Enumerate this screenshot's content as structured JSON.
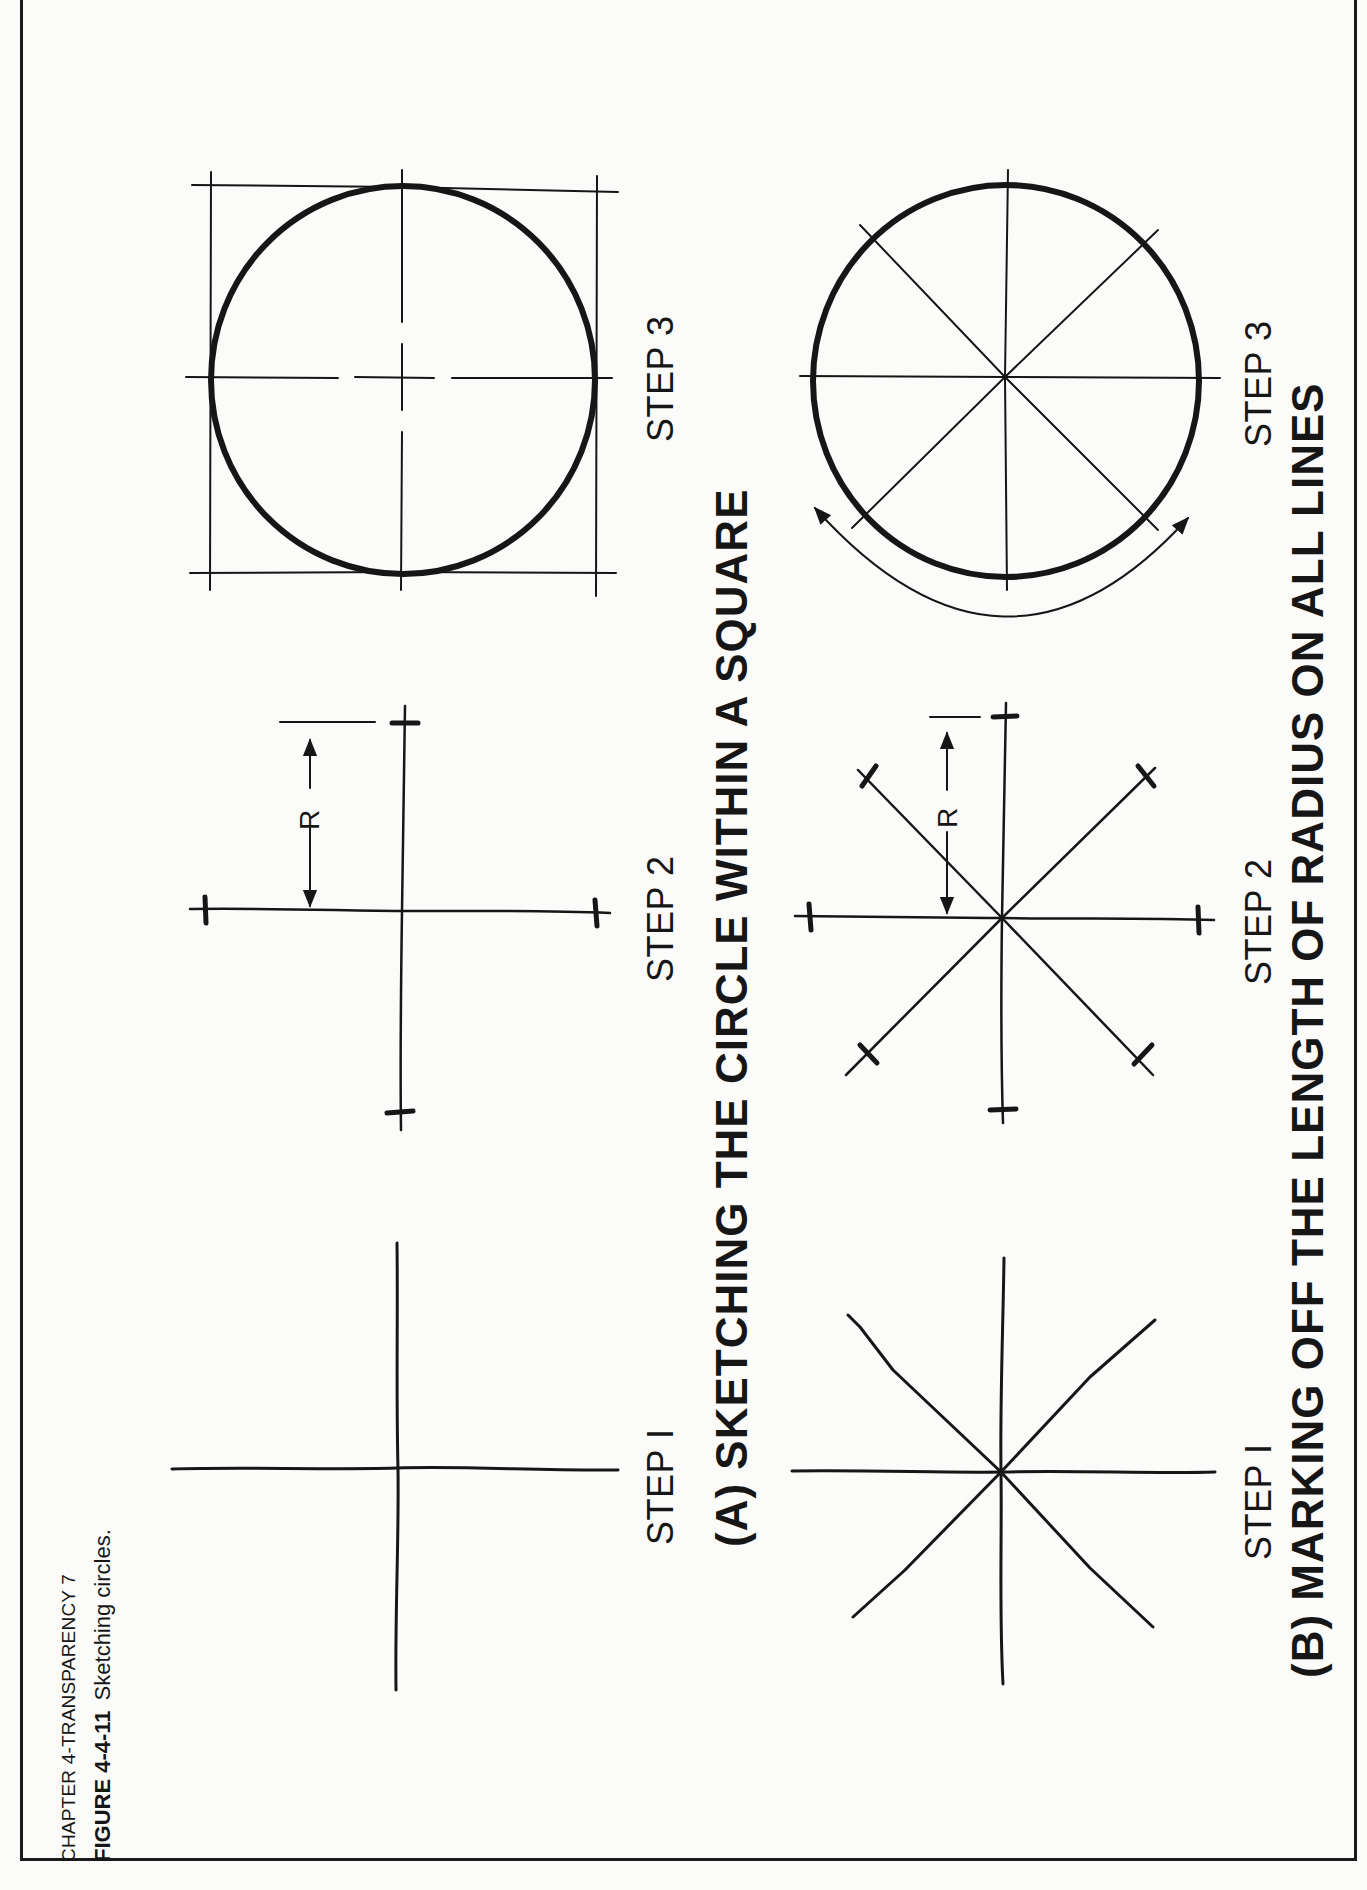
{
  "header": {
    "chapter": "CHAPTER 4-TRANSPARENCY 7",
    "figure_number": "FIGURE 4-4-11",
    "figure_caption": "Sketching circles."
  },
  "section_a": {
    "title": "(A) SKETCHING THE CIRCLE WITHIN A SQUARE",
    "steps": [
      {
        "label": "STEP I"
      },
      {
        "label": "STEP 2",
        "dimension_label": "R"
      },
      {
        "label": "STEP 3"
      }
    ]
  },
  "section_b": {
    "title": "(B) MARKING OFF THE LENGTH OF RADIUS ON ALL LINES",
    "steps": [
      {
        "label": "STEP I"
      },
      {
        "label": "STEP 2",
        "dimension_label": "R"
      },
      {
        "label": "STEP 3"
      }
    ]
  },
  "colors": {
    "ink": "#161616",
    "paper": "#fbfbfa"
  }
}
